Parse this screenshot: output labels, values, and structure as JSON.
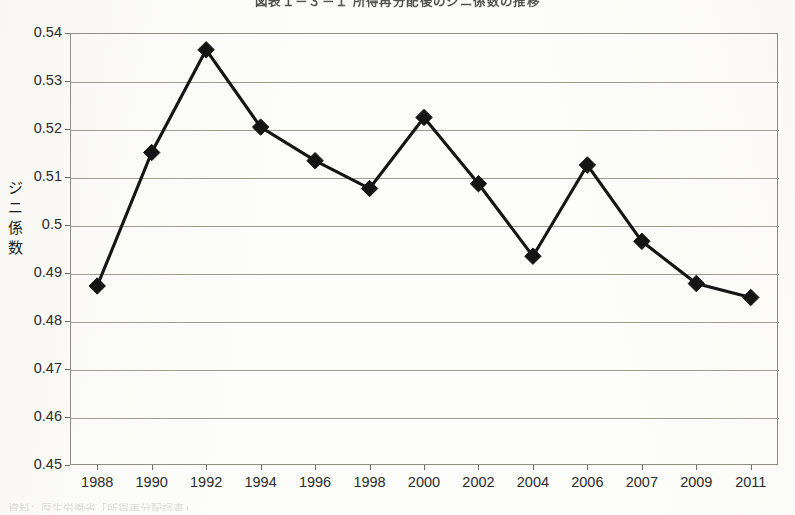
{
  "document": {
    "kind": "scanned-figure",
    "background_color": "#fdfdfb"
  },
  "chart_data": {
    "type": "line",
    "title": "図表１－３－１ 所得再分配後のジニ係数の推移",
    "xlabel": "",
    "ylabel": "ジニ係数",
    "ylabel_chars": [
      "ジ",
      "ニ",
      "係",
      "数"
    ],
    "categories": [
      "1988",
      "1990",
      "1992",
      "1994",
      "1996",
      "1998",
      "2000",
      "2002",
      "2004",
      "2006",
      "2007",
      "2009",
      "2011"
    ],
    "values": [
      0.4873,
      0.5151,
      0.5365,
      0.5204,
      0.5134,
      0.5076,
      0.5224,
      0.5086,
      0.4935,
      0.5125,
      0.4966,
      0.4878,
      0.4849
    ],
    "ylim": [
      0.45,
      0.54
    ],
    "yticks": [
      0.54,
      0.53,
      0.52,
      0.51,
      0.5,
      0.49,
      0.48,
      0.47,
      0.46,
      0.45
    ],
    "ytick_labels": [
      "0.54",
      "0.53",
      "0.52",
      "0.51",
      "0.5",
      "0.49",
      "0.48",
      "0.47",
      "0.46",
      "0.45"
    ],
    "grid": true,
    "grid_axis": "y",
    "legend": null,
    "legend_position": "none",
    "series_color": "#151515",
    "marker": "diamond",
    "annotations": []
  },
  "footnote": {
    "text": "資料：厚生労働省「所得再分配調査」"
  }
}
